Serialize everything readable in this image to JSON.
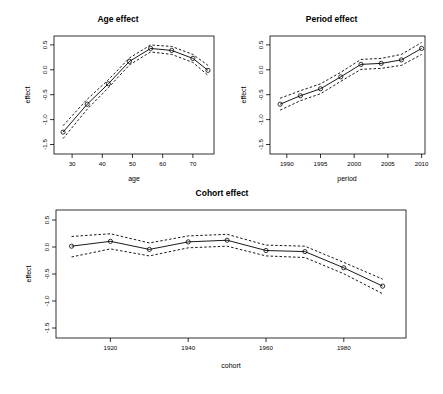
{
  "figure": {
    "background": "#ffffff",
    "line_color": "#000000",
    "point_marker": "circle-open"
  },
  "panels": [
    {
      "id": "age",
      "title": "Age effect",
      "xlabel": "age",
      "ylabel": "effect"
    },
    {
      "id": "period",
      "title": "Period effect",
      "xlabel": "period",
      "ylabel": "effect"
    },
    {
      "id": "cohort",
      "title": "Cohort effect",
      "xlabel": "cohort",
      "ylabel": "effect"
    }
  ],
  "chart_data": [
    {
      "type": "line",
      "id": "age",
      "title": "Age effect",
      "xlabel": "age",
      "ylabel": "effect",
      "xlim": [
        24,
        77
      ],
      "ylim": [
        -1.62,
        0.75
      ],
      "xticks": [
        30,
        40,
        50,
        60,
        70
      ],
      "xticklabels": [
        "30",
        "40",
        "50",
        "60",
        "70"
      ],
      "yticks": [
        -1.5,
        -1.0,
        -0.5,
        0.0,
        0.5
      ],
      "yticklabels": [
        "-1.5",
        "-1.0",
        "-0.5",
        "0.0",
        "0.5"
      ],
      "grid": false,
      "legend": "none",
      "x": [
        27,
        35,
        42,
        49,
        56,
        63,
        70,
        75
      ],
      "series": [
        {
          "name": "estimate",
          "style": "solid-with-points",
          "values": [
            -1.18,
            -0.62,
            -0.21,
            0.24,
            0.5,
            0.46,
            0.3,
            0.06
          ]
        },
        {
          "name": "upper CI",
          "style": "dashed",
          "values": [
            -1.05,
            -0.52,
            -0.13,
            0.31,
            0.57,
            0.54,
            0.38,
            0.16
          ]
        },
        {
          "name": "lower CI",
          "style": "dashed",
          "values": [
            -1.31,
            -0.72,
            -0.29,
            0.17,
            0.43,
            0.38,
            0.22,
            -0.04
          ]
        }
      ]
    },
    {
      "type": "line",
      "id": "period",
      "title": "Period effect",
      "xlabel": "period",
      "ylabel": "effect",
      "xlim": [
        1987.5,
        2010.5
      ],
      "ylim": [
        -1.62,
        0.75
      ],
      "xticks": [
        1990,
        1995,
        2000,
        2005,
        2010
      ],
      "xticklabels": [
        "1990",
        "1995",
        "2000",
        "2005",
        "2010"
      ],
      "yticks": [
        -1.5,
        -1.0,
        -0.5,
        0.0,
        0.5
      ],
      "yticklabels": [
        "-1.5",
        "-1.0",
        "-0.5",
        "0.0",
        "0.5"
      ],
      "grid": false,
      "legend": "none",
      "x": [
        1989,
        1992,
        1995,
        1998,
        2001,
        2004,
        2007,
        2010
      ],
      "series": [
        {
          "name": "estimate",
          "style": "solid-with-points",
          "values": [
            -0.62,
            -0.45,
            -0.31,
            -0.07,
            0.18,
            0.2,
            0.27,
            0.5
          ]
        },
        {
          "name": "upper CI",
          "style": "dashed",
          "values": [
            -0.5,
            -0.35,
            -0.21,
            0.02,
            0.28,
            0.3,
            0.38,
            0.62
          ]
        },
        {
          "name": "lower CI",
          "style": "dashed",
          "values": [
            -0.74,
            -0.55,
            -0.41,
            -0.16,
            0.08,
            0.1,
            0.16,
            0.38
          ]
        }
      ]
    },
    {
      "type": "line",
      "id": "cohort",
      "title": "Cohort effect",
      "xlabel": "cohort",
      "ylabel": "effect",
      "xlim": [
        1906,
        1996
      ],
      "ylim": [
        -1.62,
        0.75
      ],
      "xticks": [
        1920,
        1940,
        1960,
        1980
      ],
      "xticklabels": [
        "1920",
        "1940",
        "1960",
        "1980"
      ],
      "yticks": [
        -1.5,
        -1.0,
        -0.5,
        0.0,
        0.5
      ],
      "yticklabels": [
        "-1.5",
        "-1.0",
        "-0.5",
        "0.0",
        "0.5"
      ],
      "grid": false,
      "legend": "none",
      "x": [
        1910,
        1920,
        1930,
        1940,
        1950,
        1960,
        1970,
        1980,
        1990
      ],
      "series": [
        {
          "name": "estimate",
          "style": "solid-with-points",
          "values": [
            0.08,
            0.17,
            0.02,
            0.16,
            0.19,
            0.0,
            -0.02,
            -0.32,
            -0.66
          ]
        },
        {
          "name": "upper CI",
          "style": "dashed",
          "values": [
            0.26,
            0.31,
            0.14,
            0.27,
            0.3,
            0.1,
            0.08,
            -0.22,
            -0.53
          ]
        },
        {
          "name": "lower CI",
          "style": "dashed",
          "values": [
            -0.12,
            0.03,
            -0.1,
            0.05,
            0.08,
            -0.1,
            -0.13,
            -0.43,
            -0.8
          ]
        }
      ]
    }
  ]
}
